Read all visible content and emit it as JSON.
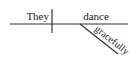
{
  "diagram": {
    "type": "sentence-diagram",
    "subject": "They",
    "verb": "dance",
    "modifier": "gracefully",
    "modifier_role": "adverb modifying verb",
    "colors": {
      "ink": "#222222",
      "background": "#ffffff"
    }
  }
}
